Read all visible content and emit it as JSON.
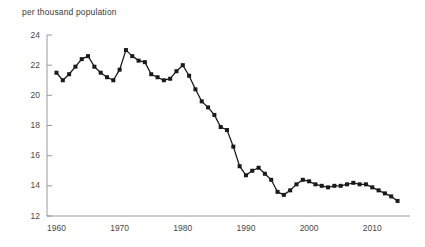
{
  "chart_data": {
    "type": "line",
    "title": "per thousand population",
    "xlabel": "",
    "ylabel": "per thousand population",
    "grid": false,
    "legend": "none",
    "marker": "square",
    "series_color": "#1a1a1a",
    "axis_color": "#9a9a9a",
    "xlim": [
      1958.5,
      2015.5
    ],
    "ylim": [
      12,
      24
    ],
    "ytick_labels": [
      "12",
      "14",
      "16",
      "18",
      "20",
      "22",
      "24"
    ],
    "yticks": [
      12,
      14,
      16,
      18,
      20,
      22,
      24
    ],
    "xtick_labels": [
      "1960",
      "1970",
      "1980",
      "1990",
      "2000",
      "2010"
    ],
    "xticks": [
      1960,
      1970,
      1980,
      1990,
      2000,
      2010
    ],
    "x": [
      1960,
      1961,
      1962,
      1963,
      1964,
      1965,
      1966,
      1967,
      1968,
      1969,
      1970,
      1971,
      1972,
      1973,
      1974,
      1975,
      1976,
      1977,
      1978,
      1979,
      1980,
      1981,
      1982,
      1983,
      1984,
      1985,
      1986,
      1987,
      1988,
      1989,
      1990,
      1991,
      1992,
      1993,
      1994,
      1995,
      1996,
      1997,
      1998,
      1999,
      2000,
      2001,
      2002,
      2003,
      2004,
      2005,
      2006,
      2007,
      2008,
      2009,
      2010,
      2011,
      2012,
      2013,
      2014
    ],
    "values": [
      21.5,
      21.0,
      21.4,
      21.9,
      22.4,
      22.6,
      21.9,
      21.5,
      21.2,
      21.0,
      21.7,
      23.0,
      22.6,
      22.3,
      22.2,
      21.4,
      21.2,
      21.0,
      21.1,
      21.6,
      22.0,
      21.3,
      20.4,
      19.6,
      19.2,
      18.7,
      17.9,
      17.7,
      16.6,
      15.3,
      14.7,
      15.0,
      15.2,
      14.8,
      14.4,
      13.6,
      13.4,
      13.7,
      14.1,
      14.4,
      14.3,
      14.1,
      14.0,
      13.9,
      14.0,
      14.0,
      14.1,
      14.2,
      14.1,
      14.1,
      13.9,
      13.7,
      13.5,
      13.3,
      13.0
    ],
    "annotations": []
  }
}
